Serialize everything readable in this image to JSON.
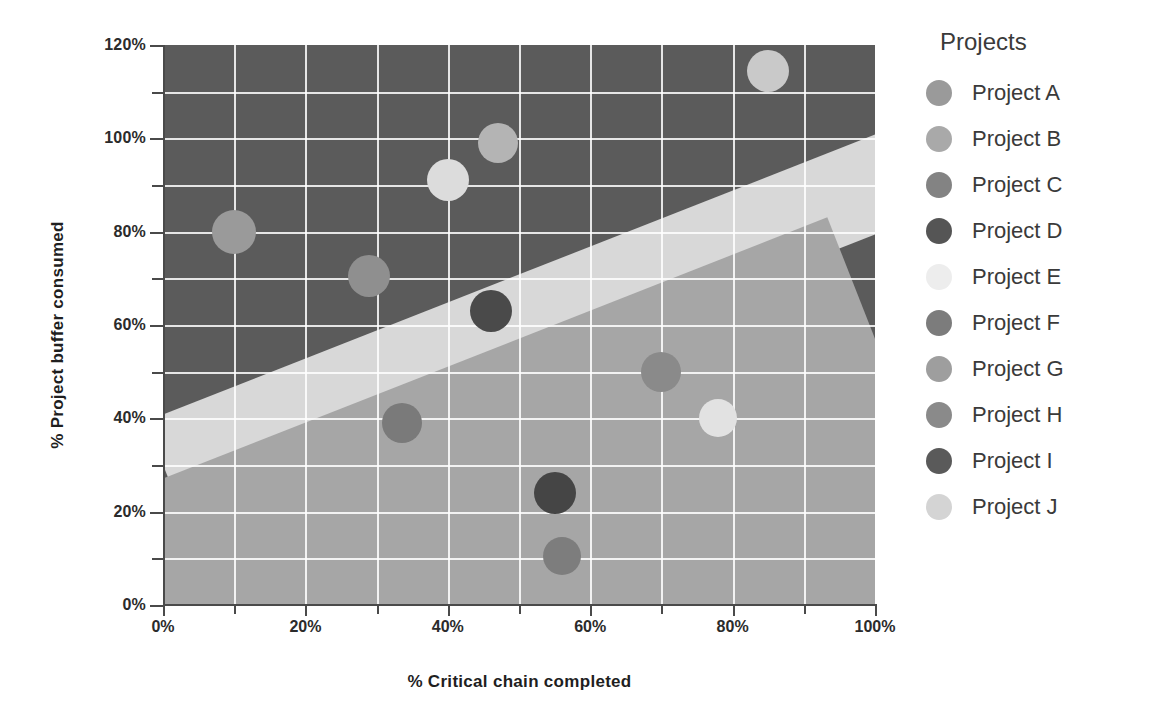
{
  "chart_data": {
    "type": "scatter",
    "title": "",
    "xlabel": "% Critical chain completed",
    "ylabel": "% Project buffer consumed",
    "xlim": [
      0,
      100
    ],
    "ylim": [
      0,
      120
    ],
    "grid": true,
    "legend_position": "right",
    "legend_title": "Projects",
    "x_ticks": [
      "0%",
      "20%",
      "40%",
      "60%",
      "80%",
      "100%"
    ],
    "x_tick_values": [
      0,
      20,
      40,
      60,
      80,
      100
    ],
    "y_ticks": [
      "0%",
      "20%",
      "40%",
      "60%",
      "80%",
      "100%",
      "120%"
    ],
    "y_tick_values": [
      0,
      20,
      40,
      60,
      80,
      100,
      120
    ],
    "points": [
      {
        "name": "Project A",
        "x": 10,
        "y": 80,
        "color": "#9a9a9a",
        "r": 22
      },
      {
        "name": "Project B",
        "x": 40,
        "y": 91,
        "color": "#dcdcdc",
        "r": 21
      },
      {
        "name": "Project C",
        "x": 47,
        "y": 99,
        "color": "#b4b4b4",
        "r": 20
      },
      {
        "name": "Project D",
        "x": 46,
        "y": 63,
        "color": "#4a4a4a",
        "r": 21
      },
      {
        "name": "Project E",
        "x": 56,
        "y": 10.5,
        "color": "#7d7d7d",
        "r": 19
      },
      {
        "name": "Project F",
        "x": 33.5,
        "y": 39,
        "color": "#7a7a7a",
        "r": 20
      },
      {
        "name": "Project G",
        "x": 78,
        "y": 40,
        "color": "#e2e2e2",
        "r": 19
      },
      {
        "name": "Project H",
        "x": 70,
        "y": 50,
        "color": "#8a8a8a",
        "r": 20
      },
      {
        "name": "Project I",
        "x": 55,
        "y": 24,
        "color": "#454545",
        "r": 21
      },
      {
        "name": "Project J",
        "x": 85,
        "y": 114.5,
        "color": "#c9c9c9",
        "r": 21
      },
      {
        "name": "Project K",
        "x": 29,
        "y": 70.5,
        "color": "#8f8f8f",
        "r": 21
      }
    ],
    "zones": [
      {
        "name": "over-buffer-zone",
        "color": "#1d1d1d"
      },
      {
        "name": "red-zone",
        "color": "#5b5b5b"
      },
      {
        "name": "yellow-zone",
        "color": "#d8d8d8"
      },
      {
        "name": "green-zone",
        "color": "#a6a6a6"
      }
    ]
  },
  "legend": {
    "title": "Projects",
    "items": [
      {
        "label": "Project A",
        "color": "#9a9a9a"
      },
      {
        "label": "Project B",
        "color": "#a9a9a9"
      },
      {
        "label": "Project C",
        "color": "#838383"
      },
      {
        "label": "Project D",
        "color": "#555555"
      },
      {
        "label": "Project E",
        "color": "#ededed"
      },
      {
        "label": "Project F",
        "color": "#7c7c7c"
      },
      {
        "label": "Project G",
        "color": "#9e9e9e"
      },
      {
        "label": "Project H",
        "color": "#8a8a8a"
      },
      {
        "label": "Project I",
        "color": "#5a5a5a"
      },
      {
        "label": "Project J",
        "color": "#d4d4d4"
      }
    ]
  },
  "axes": {
    "x_title": "% Critical chain completed",
    "y_title": "% Project buffer consumed"
  }
}
